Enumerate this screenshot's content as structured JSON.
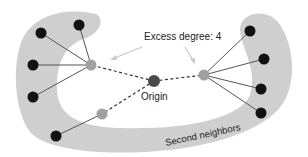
{
  "labels": {
    "excess_degree": "Excess degree: 4",
    "origin": "Origin",
    "second_neighbors": "Second neighbors"
  },
  "colors": {
    "band": "#cfcfcf",
    "node_black": "#111111",
    "node_gray": "#a0a0a0",
    "node_origin": "#4a4a4a",
    "edge": "#555555",
    "arrow": "#c8c8c8"
  },
  "nodes": {
    "origin": {
      "x": 154,
      "y": 81
    },
    "first_neighbors": [
      {
        "x": 91,
        "y": 65
      },
      {
        "x": 204,
        "y": 75
      },
      {
        "x": 102,
        "y": 114
      }
    ],
    "second_neighbors": [
      {
        "x": 41,
        "y": 33
      },
      {
        "x": 79,
        "y": 25
      },
      {
        "x": 33,
        "y": 65
      },
      {
        "x": 33,
        "y": 97
      },
      {
        "x": 56,
        "y": 136
      },
      {
        "x": 250,
        "y": 31
      },
      {
        "x": 264,
        "y": 59
      },
      {
        "x": 261,
        "y": 89
      },
      {
        "x": 261,
        "y": 113
      }
    ]
  }
}
